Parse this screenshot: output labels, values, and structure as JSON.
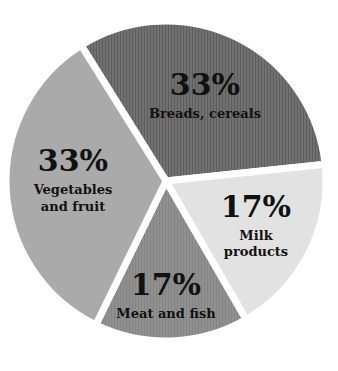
{
  "chart_data": {
    "type": "pie",
    "title": "",
    "categories": [
      "Breads, cereals",
      "Milk products",
      "Meat and fish",
      "Vegetables and fruit"
    ],
    "values": [
      33,
      17,
      17,
      33
    ],
    "unit": "%",
    "legend": "none (labels inside slices)",
    "slices": [
      {
        "label": "Breads, cereals",
        "label_lines": [
          "Breads, cereals"
        ],
        "value": 33,
        "value_text": "33%",
        "color": "#6e6e6e",
        "start_deg": -122,
        "end_deg": -6
      },
      {
        "label": "Milk products",
        "label_lines": [
          "Milk",
          "products"
        ],
        "value": 17,
        "value_text": "17%",
        "color": "#e2e2e2",
        "start_deg": -6,
        "end_deg": 60
      },
      {
        "label": "Meat and fish",
        "label_lines": [
          "Meat and fish"
        ],
        "value": 17,
        "value_text": "17%",
        "color": "#8e8e8e",
        "start_deg": 60,
        "end_deg": 116
      },
      {
        "label": "Vegetables and fruit",
        "label_lines": [
          "Vegetables",
          "and fruit"
        ],
        "value": 33,
        "value_text": "33%",
        "color": "#aaaaaa",
        "start_deg": 116,
        "end_deg": 238
      }
    ],
    "geometry": {
      "cx": 166,
      "cy": 181,
      "r": 160
    }
  }
}
